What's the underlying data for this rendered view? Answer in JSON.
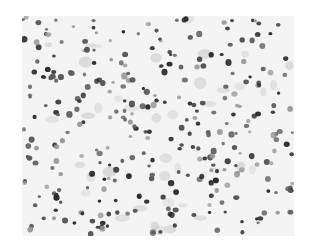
{
  "image": {
    "subject": "grayscale histology micrograph with scattered stained cell nuclei",
    "colors": {
      "background": "#f4f4f4",
      "nucleus_dark": "#2a2a2a",
      "nucleus_mid": "#5a5a5a",
      "nucleus_light": "#9a9a9a"
    },
    "bounds": {
      "x": 22,
      "y": 16,
      "width": 272,
      "height": 220
    }
  }
}
